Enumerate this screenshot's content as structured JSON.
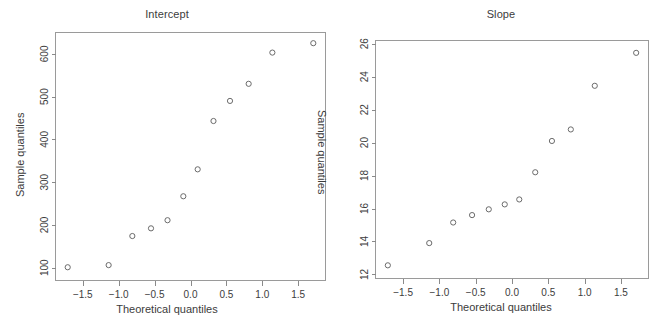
{
  "figure": {
    "background": "#ffffff",
    "axis_color": "#8a8a8a",
    "point_color": "#6b6b6b",
    "text_color": "#3c3c3c"
  },
  "panels": [
    {
      "id": "intercept",
      "title": "Intercept",
      "xlabel": "Theoretical quantiles",
      "ylabel": "Sample quantiles",
      "ylabel_inner": "Sample quantiles"
    },
    {
      "id": "slope",
      "title": "Slope",
      "xlabel": "Theoretical quantiles",
      "ylabel": "",
      "ylabel_inner": ""
    }
  ],
  "chart_data": [
    {
      "type": "scatter",
      "title": "Intercept",
      "xlabel": "Theoretical quantiles",
      "ylabel": "Sample quantiles",
      "xticks": [
        -1.5,
        -1.0,
        -0.5,
        0.0,
        0.5,
        1.0,
        1.5
      ],
      "xticklabels": [
        "-1.5",
        "-1.0",
        "-0.5",
        "0.0",
        "0.5",
        "1.0",
        "1.5"
      ],
      "yticks": [
        100,
        200,
        300,
        400,
        500,
        600
      ],
      "yticklabels": [
        "100",
        "200",
        "300",
        "400",
        "500",
        "600"
      ],
      "xlim": [
        -1.88,
        1.88
      ],
      "ylim": [
        70,
        650
      ],
      "grid": false,
      "legend": null,
      "marker": "open-circle",
      "x": [
        -1.71,
        -1.14,
        -0.81,
        -0.55,
        -0.32,
        -0.1,
        0.1,
        0.32,
        0.55,
        0.81,
        1.14,
        1.71
      ],
      "y": [
        101,
        106,
        174,
        192,
        211,
        267,
        330,
        443,
        490,
        530,
        603,
        625
      ]
    },
    {
      "type": "scatter",
      "title": "Slope",
      "xlabel": "Theoretical quantiles",
      "ylabel": "",
      "xticks": [
        -1.5,
        -1.0,
        -0.5,
        0.0,
        0.5,
        1.0,
        1.5
      ],
      "xticklabels": [
        "-1.5",
        "-1.0",
        "-0.5",
        "0.0",
        "0.5",
        "1.0",
        "1.5"
      ],
      "yticks": [
        12,
        14,
        16,
        18,
        20,
        22,
        24,
        26
      ],
      "yticklabels": [
        "12",
        "14",
        "16",
        "18",
        "20",
        "22",
        "24",
        "26"
      ],
      "xlim": [
        -1.88,
        1.88
      ],
      "ylim": [
        11.75,
        26.2
      ],
      "grid": false,
      "legend": null,
      "marker": "open-circle",
      "x": [
        -1.71,
        -1.14,
        -0.81,
        -0.55,
        -0.32,
        -0.1,
        0.1,
        0.32,
        0.55,
        0.81,
        1.14,
        1.71
      ],
      "y": [
        12.55,
        13.9,
        15.15,
        15.6,
        15.95,
        16.25,
        16.55,
        18.2,
        20.1,
        20.8,
        23.45,
        25.45
      ]
    }
  ]
}
